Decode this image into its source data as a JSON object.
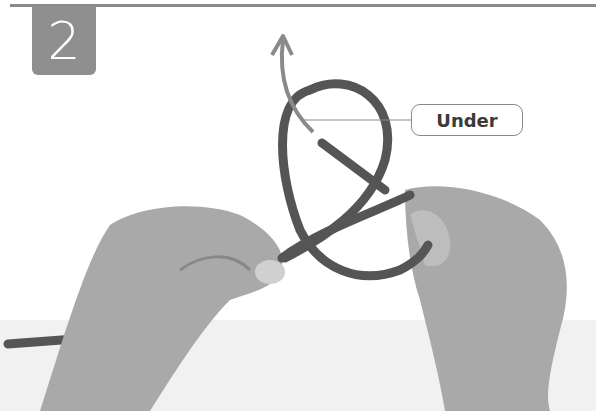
{
  "step": {
    "number": "2"
  },
  "callout": {
    "label": "Under"
  },
  "photo": {
    "subject": "hands-tying-rope-knot",
    "tone": "grayscale"
  },
  "colors": {
    "step_badge": "#8f8f8f",
    "rope": "#555555",
    "skin": "#a8a8a8",
    "arrow": "#8a8a8a",
    "rule": "#8a8a8a"
  }
}
